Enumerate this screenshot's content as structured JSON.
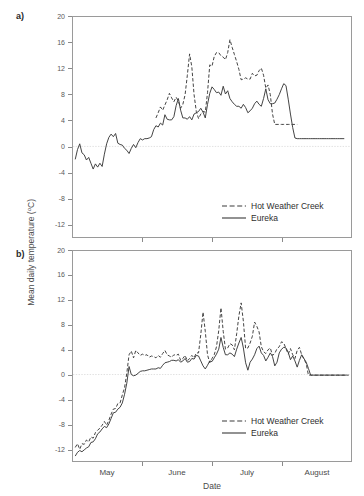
{
  "figure": {
    "panels": [
      {
        "letter": "a)"
      },
      {
        "letter": "b)"
      }
    ],
    "y_axis_title_main": "Mean daily temperature (",
    "y_axis_title_unit": "o",
    "y_axis_title_tail": "C)",
    "x_axis_title": "Date"
  },
  "legend": {
    "series": [
      {
        "name": "Hot Weather Creek",
        "style": "dashed",
        "color": "#3a3a3a"
      },
      {
        "name": "Eureka",
        "style": "solid",
        "color": "#3a3a3a"
      }
    ]
  },
  "chart_data": [
    {
      "id": "panel-a",
      "type": "line",
      "title": "",
      "panel_label": "a)",
      "xlabel": "Date",
      "ylabel": "Mean daily temperature (oC)",
      "ylim": [
        -14,
        20
      ],
      "yticks": [
        20,
        16,
        12,
        8,
        4,
        0,
        -4,
        -8,
        -12
      ],
      "xlim": [
        0,
        124
      ],
      "xticks_labeled": [
        "May",
        "June",
        "July",
        "August"
      ],
      "xtick_positions_day": [
        0,
        31,
        62,
        93,
        124
      ],
      "grid": false,
      "zero_reference_line": true,
      "legend_position": "lower-right",
      "series": [
        {
          "name": "Eureka",
          "style": "solid",
          "x": [
            1,
            2,
            3,
            4,
            5,
            6,
            7,
            8,
            9,
            10,
            11,
            12,
            13,
            14,
            15,
            16,
            17,
            18,
            19,
            20,
            21,
            22,
            23,
            24,
            25,
            26,
            27,
            28,
            29,
            30,
            31,
            32,
            33,
            34,
            35,
            36,
            37,
            38,
            39,
            40,
            41,
            42,
            43,
            44,
            45,
            46,
            47,
            48,
            49,
            50,
            51,
            52,
            53,
            54,
            55,
            56,
            57,
            58,
            59,
            60,
            61,
            62,
            63,
            64,
            65,
            66,
            67,
            68,
            69,
            70,
            71,
            72,
            73,
            74,
            75,
            76,
            77,
            78,
            79,
            80,
            81,
            82,
            83,
            84,
            85,
            86,
            87,
            88,
            89,
            90,
            91,
            92,
            93,
            94,
            95,
            96,
            97,
            98,
            99,
            100,
            101,
            102,
            103,
            104,
            105,
            106,
            107,
            108,
            109,
            110,
            111,
            112,
            113,
            114,
            115,
            116,
            117,
            118,
            119,
            120,
            121,
            122,
            123
          ],
          "values": [
            -2.0,
            -0.5,
            0.4,
            -1.0,
            -1.3,
            -2.1,
            -1.7,
            -2.6,
            -3.5,
            -2.7,
            -3.2,
            -2.6,
            -3.1,
            -1.2,
            0.4,
            1.4,
            1.9,
            1.5,
            2.0,
            0.5,
            0.3,
            0.2,
            -0.3,
            -0.6,
            -1.1,
            -0.3,
            0.3,
            -0.2,
            0.6,
            1.2,
            1.0,
            1.2,
            1.2,
            1.3,
            1.5,
            2.6,
            3.2,
            3.0,
            3.6,
            3.3,
            4.9,
            4.2,
            4.1,
            4.1,
            4.6,
            6.3,
            7.4,
            5.6,
            4.4,
            4.4,
            4.2,
            4.6,
            4.1,
            5.0,
            5.2,
            5.4,
            5.9,
            5.3,
            4.4,
            6.5,
            8.2,
            9.2,
            8.8,
            8.3,
            8.4,
            7.9,
            9.3,
            8.1,
            8.6,
            7.4,
            6.9,
            6.5,
            6.2,
            6.2,
            5.9,
            6.5,
            6.0,
            5.2,
            5.5,
            5.9,
            6.6,
            7.0,
            6.5,
            6.2,
            7.4,
            8.9,
            7.2,
            6.6,
            6.6,
            6.7,
            7.3,
            8.0,
            8.9,
            9.7,
            9.4,
            7.3,
            5.0,
            2.9,
            1.3,
            1.2,
            1.2,
            1.2,
            1.2,
            1.2,
            1.2,
            1.2,
            1.2,
            1.2,
            1.2,
            1.2,
            1.2,
            1.2,
            1.2,
            1.2,
            1.2,
            1.2,
            1.2,
            1.2,
            1.2,
            1.2,
            1.2
          ]
        },
        {
          "name": "Hot Weather Creek",
          "style": "dashed",
          "start_index": 36,
          "x": [
            37,
            38,
            39,
            40,
            41,
            42,
            43,
            44,
            45,
            46,
            47,
            48,
            49,
            50,
            51,
            52,
            53,
            54,
            55,
            56,
            57,
            58,
            59,
            60,
            61,
            62,
            63,
            64,
            65,
            66,
            67,
            68,
            69,
            70,
            71,
            72,
            73,
            74,
            75,
            76,
            77,
            78,
            79,
            80,
            81,
            82,
            83,
            84,
            85,
            86,
            87,
            88,
            89,
            90,
            91,
            92,
            93,
            94,
            95,
            96,
            97,
            98,
            99,
            100
          ],
          "values": [
            4.4,
            5.2,
            6.1,
            5.6,
            6.4,
            7.2,
            8.2,
            7.5,
            6.9,
            7.6,
            7.0,
            5.9,
            6.5,
            8.0,
            11.0,
            14.3,
            12.3,
            8.0,
            5.4,
            4.3,
            5.0,
            5.4,
            5.3,
            8.3,
            12.6,
            12.4,
            13.9,
            14.5,
            14.5,
            14.0,
            13.8,
            13.4,
            14.5,
            16.5,
            15.3,
            14.2,
            13.1,
            11.9,
            10.3,
            10.4,
            10.6,
            10.4,
            10.4,
            11.3,
            10.9,
            11.0,
            11.7,
            12.1,
            11.0,
            9.0,
            9.5,
            8.0,
            5.0,
            3.4,
            3.4,
            3.4,
            3.4,
            3.4,
            3.4,
            3.4,
            3.4,
            3.4,
            3.4,
            3.4
          ]
        }
      ]
    },
    {
      "id": "panel-b",
      "type": "line",
      "title": "",
      "panel_label": "b)",
      "xlabel": "Date",
      "ylabel": "Mean daily temperature (oC)",
      "ylim": [
        -14,
        20
      ],
      "yticks": [
        20,
        16,
        12,
        8,
        4,
        0,
        -4,
        -8,
        -12
      ],
      "xlim": [
        0,
        124
      ],
      "xticks_labeled": [
        "May",
        "June",
        "July",
        "August"
      ],
      "xtick_positions_day": [
        0,
        31,
        62,
        93,
        124
      ],
      "grid": false,
      "zero_reference_line": true,
      "legend_position": "lower-right",
      "series": [
        {
          "name": "Eureka",
          "style": "solid",
          "x": [
            1,
            2,
            3,
            4,
            5,
            6,
            7,
            8,
            9,
            10,
            11,
            12,
            13,
            14,
            15,
            16,
            17,
            18,
            19,
            20,
            21,
            22,
            23,
            24,
            25,
            26,
            27,
            28,
            29,
            30,
            31,
            32,
            33,
            34,
            35,
            36,
            37,
            38,
            39,
            40,
            41,
            42,
            43,
            44,
            45,
            46,
            47,
            48,
            49,
            50,
            51,
            52,
            53,
            54,
            55,
            56,
            57,
            58,
            59,
            60,
            61,
            62,
            63,
            64,
            65,
            66,
            67,
            68,
            69,
            70,
            71,
            72,
            73,
            74,
            75,
            76,
            77,
            78,
            79,
            80,
            81,
            82,
            83,
            84,
            85,
            86,
            87,
            88,
            89,
            90,
            91,
            92,
            93,
            94,
            95,
            96,
            97,
            98,
            99,
            100,
            101,
            102,
            103,
            104,
            105,
            106,
            107,
            108,
            109,
            110,
            111,
            112,
            113,
            114,
            115,
            116,
            117,
            118,
            119,
            120,
            121,
            122,
            123
          ],
          "values": [
            -13.2,
            -12.6,
            -12.3,
            -12.5,
            -12.2,
            -11.9,
            -11.7,
            -11.0,
            -10.9,
            -10.4,
            -9.6,
            -9.3,
            -8.8,
            -8.4,
            -8.6,
            -8.0,
            -7.1,
            -6.2,
            -6.1,
            -5.6,
            -5.3,
            -4.6,
            -3.2,
            -1.4,
            1.3,
            0.0,
            -0.2,
            -0.1,
            0.2,
            0.5,
            0.6,
            0.6,
            0.7,
            0.8,
            0.9,
            0.9,
            0.9,
            1.1,
            1.0,
            1.5,
            1.9,
            2.0,
            2.1,
            2.3,
            2.3,
            2.2,
            2.4,
            2.0,
            2.2,
            2.6,
            2.0,
            2.1,
            2.6,
            2.5,
            3.1,
            3.0,
            2.2,
            1.4,
            0.9,
            1.5,
            2.2,
            2.1,
            2.7,
            3.3,
            4.1,
            6.0,
            4.4,
            3.2,
            3.2,
            3.5,
            3.3,
            2.9,
            4.1,
            5.1,
            6.0,
            4.3,
            1.9,
            0.7,
            2.0,
            2.5,
            3.2,
            4.2,
            4.6,
            3.5,
            3.1,
            2.2,
            2.8,
            3.5,
            2.9,
            1.4,
            2.0,
            3.5,
            4.1,
            4.4,
            4.3,
            3.6,
            2.4,
            3.0,
            2.2,
            1.2,
            2.3,
            3.2,
            2.6,
            2.0,
            1.0,
            -0.1,
            -0.1,
            -0.1,
            -0.1,
            -0.1,
            -0.1,
            -0.1,
            -0.1,
            -0.1,
            -0.1,
            -0.1,
            -0.1,
            -0.1,
            -0.1,
            -0.1,
            -0.1,
            -0.1,
            -0.1
          ]
        },
        {
          "name": "Hot Weather Creek",
          "style": "dashed",
          "x": [
            1,
            2,
            3,
            4,
            5,
            6,
            7,
            8,
            9,
            10,
            11,
            12,
            13,
            14,
            15,
            16,
            17,
            18,
            19,
            20,
            21,
            22,
            23,
            24,
            25,
            26,
            27,
            28,
            29,
            30,
            31,
            32,
            33,
            34,
            35,
            36,
            37,
            38,
            39,
            40,
            41,
            42,
            43,
            44,
            45,
            46,
            47,
            48,
            49,
            50,
            51,
            52,
            53,
            54,
            55,
            56,
            57,
            58,
            59,
            60,
            61,
            62,
            63,
            64,
            65,
            66,
            67,
            68,
            69,
            70,
            71,
            72,
            73,
            74,
            75,
            76,
            77,
            78,
            79,
            80,
            81,
            82,
            83,
            84,
            85,
            86,
            87,
            88,
            89,
            90,
            91,
            92,
            93,
            94,
            95,
            96,
            97,
            98,
            99,
            100,
            101,
            102,
            103,
            104,
            105,
            106,
            107,
            108,
            109,
            110,
            111,
            112,
            113,
            114,
            115,
            116,
            117,
            118,
            119,
            120,
            121,
            122,
            123
          ],
          "values": [
            -11.8,
            -11.2,
            -12.1,
            -11.2,
            -11.3,
            -10.6,
            -10.9,
            -10.1,
            -10.3,
            -9.4,
            -9.0,
            -8.7,
            -8.2,
            -7.6,
            -8.2,
            -7.4,
            -6.4,
            -5.6,
            -5.5,
            -4.7,
            -4.6,
            -3.3,
            -2.1,
            0.2,
            3.2,
            3.8,
            2.7,
            3.9,
            3.5,
            3.1,
            3.3,
            3.1,
            3.2,
            2.8,
            3.0,
            2.9,
            2.7,
            3.1,
            2.8,
            3.4,
            3.9,
            3.2,
            3.0,
            2.8,
            3.2,
            3.1,
            3.3,
            2.3,
            2.6,
            3.1,
            2.2,
            2.6,
            3.1,
            2.7,
            3.5,
            3.5,
            6.5,
            10.1,
            7.0,
            3.2,
            1.9,
            2.6,
            3.2,
            4.5,
            7.1,
            10.8,
            7.0,
            4.1,
            4.3,
            5.0,
            4.8,
            4.0,
            6.6,
            9.5,
            11.6,
            8.6,
            4.2,
            4.3,
            5.1,
            6.2,
            8.5,
            7.8,
            6.9,
            4.5,
            3.7,
            3.4,
            4.0,
            4.3,
            3.1,
            3.4,
            4.2,
            4.5,
            5.3,
            5.1,
            4.2,
            3.3,
            4.2,
            3.2,
            2.6,
            3.9,
            4.4,
            3.2,
            2.5,
            1.8,
            -0.1,
            -0.1,
            -0.1,
            -0.1,
            -0.1,
            -0.1,
            -0.1,
            -0.1,
            -0.1,
            -0.1,
            -0.1,
            -0.1,
            -0.1,
            -0.1,
            -0.1,
            -0.1,
            -0.1,
            -0.1
          ]
        }
      ]
    }
  ]
}
